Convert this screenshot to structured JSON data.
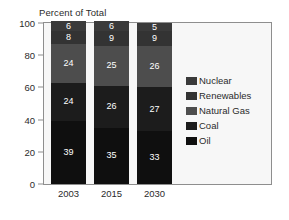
{
  "chart_data": {
    "type": "bar",
    "subtype": "stacked-percent-column",
    "title": "Percent of Total",
    "xlabel": "",
    "ylabel": "",
    "ylim": [
      0,
      100
    ],
    "yticks": [
      0,
      20,
      40,
      60,
      80,
      100
    ],
    "grid": false,
    "legend_position": "right",
    "categories": [
      "2003",
      "2015",
      "2030"
    ],
    "series": [
      {
        "name": "Oil",
        "values": [
          39,
          35,
          33
        ],
        "color": "#0f0f0f"
      },
      {
        "name": "Coal",
        "values": [
          24,
          26,
          27
        ],
        "color": "#1c1c1c"
      },
      {
        "name": "Natural Gas",
        "values": [
          24,
          25,
          26
        ],
        "color": "#4d4d4d"
      },
      {
        "name": "Renewables",
        "values": [
          8,
          9,
          9
        ],
        "color": "#333333"
      },
      {
        "name": "Nuclear",
        "values": [
          6,
          6,
          5
        ],
        "color": "#3a3a3a"
      }
    ],
    "legend_entries": [
      {
        "label": "Nuclear",
        "color": "#3a3a3a"
      },
      {
        "label": "Renewables",
        "color": "#333333"
      },
      {
        "label": "Natural Gas",
        "color": "#4d4d4d"
      },
      {
        "label": "Coal",
        "color": "#1c1c1c"
      },
      {
        "label": "Oil",
        "color": "#0f0f0f"
      }
    ],
    "stacks": [
      {
        "category": "2003",
        "segments": [
          {
            "name": "Nuclear",
            "value": 6,
            "label": "6",
            "color": "#3a3a3a"
          },
          {
            "name": "Renewables",
            "value": 8,
            "label": "8",
            "color": "#333333"
          },
          {
            "name": "Natural Gas",
            "value": 24,
            "label": "24",
            "color": "#4d4d4d"
          },
          {
            "name": "Coal",
            "value": 24,
            "label": "24",
            "color": "#1c1c1c"
          },
          {
            "name": "Oil",
            "value": 39,
            "label": "39",
            "color": "#0f0f0f"
          }
        ]
      },
      {
        "category": "2015",
        "segments": [
          {
            "name": "Nuclear",
            "value": 6,
            "label": "6",
            "color": "#3a3a3a"
          },
          {
            "name": "Renewables",
            "value": 9,
            "label": "9",
            "color": "#333333"
          },
          {
            "name": "Natural Gas",
            "value": 25,
            "label": "25",
            "color": "#4d4d4d"
          },
          {
            "name": "Coal",
            "value": 26,
            "label": "26",
            "color": "#1c1c1c"
          },
          {
            "name": "Oil",
            "value": 35,
            "label": "35",
            "color": "#0f0f0f"
          }
        ]
      },
      {
        "category": "2030",
        "segments": [
          {
            "name": "Nuclear",
            "value": 5,
            "label": "5",
            "color": "#3a3a3a"
          },
          {
            "name": "Renewables",
            "value": 9,
            "label": "9",
            "color": "#333333"
          },
          {
            "name": "Natural Gas",
            "value": 26,
            "label": "26",
            "color": "#4d4d4d"
          },
          {
            "name": "Coal",
            "value": 27,
            "label": "27",
            "color": "#1c1c1c"
          },
          {
            "name": "Oil",
            "value": 33,
            "label": "33",
            "color": "#0f0f0f"
          }
        ]
      }
    ]
  },
  "style": {
    "plot_background": "#f7f7f7",
    "frame_color": "#8e8e8e",
    "text_color": "#2b2b2b",
    "label_color": "#ffffff",
    "page_background": "#ffffff"
  }
}
